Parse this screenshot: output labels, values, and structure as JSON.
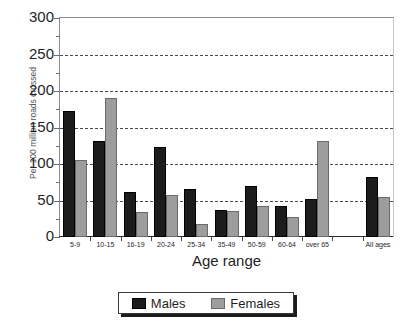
{
  "chart_data": {
    "type": "bar",
    "title": "",
    "xlabel": "Age range",
    "ylabel": "Per 100 million roads crossed",
    "categories": [
      "5-9",
      "10-15",
      "16-19",
      "20-24",
      "25-34",
      "35-49",
      "50-59",
      "60-64",
      "over 65",
      "",
      "All ages"
    ],
    "series": [
      {
        "name": "Males",
        "color": "#1c1c1c",
        "values": [
          172,
          131,
          62,
          123,
          66,
          37,
          70,
          42,
          52,
          null,
          82
        ]
      },
      {
        "name": "Females",
        "color": "#9d9d9d",
        "values": [
          105,
          191,
          34,
          58,
          18,
          35,
          42,
          27,
          132,
          null,
          55
        ]
      }
    ],
    "ylim": [
      0,
      300
    ],
    "ytick_labels": [
      "0",
      "50",
      "100",
      "150",
      "200",
      "250",
      "300"
    ],
    "ytick_values": [
      0,
      50,
      100,
      150,
      200,
      250,
      300
    ],
    "yminor_step": 25,
    "grid": true,
    "grid_axis": "y",
    "grid_style": "dashed",
    "legend_position": "bottom-center",
    "legend_entries": [
      "Males",
      "Females"
    ]
  },
  "legend": {
    "items": [
      {
        "label": "Males"
      },
      {
        "label": "Females"
      }
    ]
  }
}
